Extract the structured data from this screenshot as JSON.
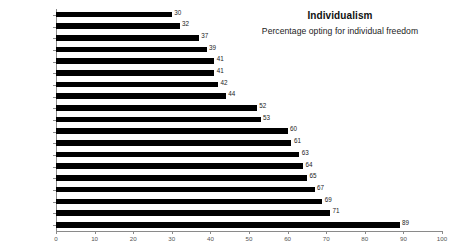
{
  "chart_data": {
    "type": "bar",
    "orientation": "horizontal",
    "title": "Individualism",
    "subtitle": "Percentage opting for individual freedom",
    "xlabel": "",
    "ylabel": "",
    "xlim": [
      0,
      100
    ],
    "xticks": [
      0,
      10,
      20,
      30,
      40,
      50,
      60,
      70,
      80,
      90,
      100
    ],
    "grid": false,
    "legend": false,
    "bar_color": "#000000",
    "categories": [
      "Egypt",
      "Mexico",
      "India",
      "Japan",
      "France",
      "China",
      "Singapore",
      "Indonesia",
      "Italy",
      "Germany",
      "Russia",
      "UK",
      "Australia",
      "Finland",
      "Netherlands",
      "Denmark",
      "USA",
      "Canada",
      "Israel"
    ],
    "values": [
      30,
      32,
      37,
      39,
      41,
      41,
      42,
      44,
      52,
      53,
      60,
      61,
      63,
      64,
      65,
      67,
      69,
      71,
      89
    ],
    "data_labels": [
      "30",
      "32",
      "37",
      "39",
      "41",
      "41",
      "42",
      "44",
      "52",
      "53",
      "60",
      "61",
      "63",
      "64",
      "65",
      "67",
      "69",
      "71",
      "89"
    ]
  }
}
